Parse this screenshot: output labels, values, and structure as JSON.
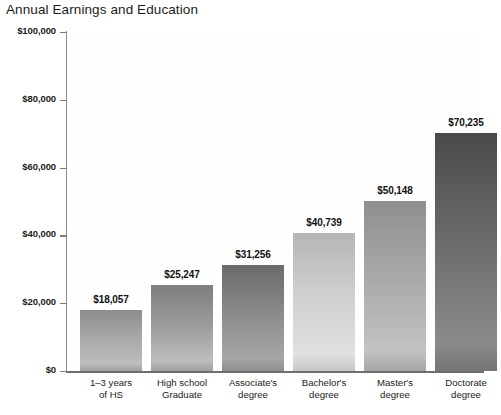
{
  "chart_data": {
    "type": "bar",
    "title": "Annual Earnings and Education",
    "xlabel": "",
    "ylabel": "",
    "ylim": [
      0,
      100000
    ],
    "grid": false,
    "legend": null,
    "categories": [
      "1–3 years of HS",
      "High school Graduate",
      "Associate's degree",
      "Bachelor's degree",
      "Master's degree",
      "Doctorate degree"
    ],
    "category_lines": [
      [
        "1–3 years",
        "of HS"
      ],
      [
        "High school",
        "Graduate"
      ],
      [
        "Associate's",
        "degree"
      ],
      [
        "Bachelor's",
        "degree"
      ],
      [
        "Master's",
        "degree"
      ],
      [
        "Doctorate",
        "degree"
      ]
    ],
    "values": [
      18057,
      25247,
      31256,
      40739,
      50148,
      70235
    ],
    "value_labels": [
      "$18,057",
      "$25,247",
      "$31,256",
      "$40,739",
      "$50,148",
      "$70,235"
    ],
    "ytick_values": [
      0,
      20000,
      40000,
      60000,
      80000,
      100000
    ],
    "ytick_labels": [
      "$0",
      "$20,000",
      "$40,000",
      "$60,000",
      "$80,000",
      "$100,000"
    ],
    "bar_colors_top": [
      "#8d8d8d",
      "#7e7e7e",
      "#6a6a6a",
      "#b5b5b5",
      "#8f8f8f",
      "#4a4a4a"
    ],
    "bar_colors_mid": [
      "#a8a8a8",
      "#9a9a9a",
      "#8a8a8a",
      "#cfcfcf",
      "#a9a9a9",
      "#6b6b6b"
    ],
    "bar_colors_bottom": [
      "#bdbdbd",
      "#bdbdbd",
      "#a6a6a6",
      "#e0e0e0",
      "#c2c2c2",
      "#8a8a8a"
    ],
    "bar_colors_base": [
      "#9e9e9e",
      "#a0a0a0",
      "#8e8e8e",
      "#c6c6c6",
      "#a6a6a6",
      "#757575"
    ],
    "axis_color": "#6e6e6e",
    "text_color": "#1b1b1b",
    "background": "#ffffff"
  },
  "source_note": ""
}
